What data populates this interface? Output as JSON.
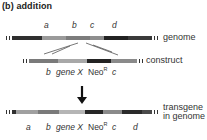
{
  "title": "(b)  addition",
  "genome": {
    "label": "genome",
    "segment_labels": [
      "a",
      "b",
      "c",
      "d"
    ],
    "segments": [
      {
        "color": "#2f2f2f",
        "flex": 25
      },
      {
        "color": "#9a9a9a",
        "flex": 20
      },
      {
        "color": "#7c7c7c",
        "flex": 20
      },
      {
        "color": "#8e8e8e",
        "flex": 12
      },
      {
        "color": "#222222",
        "flex": 20
      },
      {
        "color": "#3a3a3a",
        "flex": 20
      }
    ]
  },
  "construct": {
    "label": "construct",
    "labels": {
      "b": "b",
      "gene": "gene X",
      "neo": "Neo",
      "neo_sup": "R",
      "c": "c"
    },
    "segments": [
      {
        "color": "#7a7a7a",
        "flex": 20
      },
      {
        "color": "#a8a8a8",
        "flex": 20
      },
      {
        "color": "#232323",
        "flex": 16
      },
      {
        "color": "#8a8a8a",
        "flex": 18
      }
    ]
  },
  "arrow": {
    "direction": "down"
  },
  "transgene": {
    "label_line1": "transgene",
    "label_line2": "in genome",
    "labels": {
      "a": "a",
      "b": "b",
      "gene": "gene X",
      "neo": "Neo",
      "neo_sup": "R",
      "c": "c",
      "d": "d"
    },
    "segments": [
      {
        "color": "#303030",
        "flex": 4
      },
      {
        "color": "#a0a0a0",
        "flex": 22
      },
      {
        "color": "#7a7a7a",
        "flex": 20
      },
      {
        "color": "#b5b5b5",
        "flex": 26
      },
      {
        "color": "#262626",
        "flex": 18
      },
      {
        "color": "#8a8a8a",
        "flex": 18
      },
      {
        "color": "#2a2a2a",
        "flex": 20
      },
      {
        "color": "#4a4a4a",
        "flex": 10
      }
    ]
  }
}
